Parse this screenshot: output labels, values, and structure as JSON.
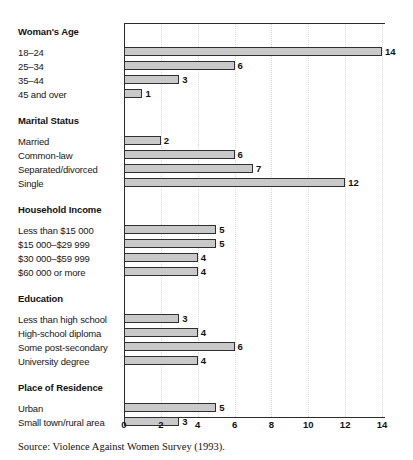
{
  "figure": {
    "source_note": "Source: Violence Against Women Survey (1993)."
  },
  "chart_data": {
    "type": "bar",
    "orientation": "horizontal",
    "title": "",
    "subtitle": "",
    "xlabel": "",
    "ylabel": "",
    "xlim": [
      0,
      14
    ],
    "xticks": [
      0,
      2,
      4,
      6,
      8,
      10,
      12,
      14
    ],
    "xtick_labels": [
      "0",
      "2",
      "4",
      "6",
      "8",
      "10",
      "12",
      "14"
    ],
    "grid": true,
    "grid_axis": "x",
    "grid_style": "dotted",
    "legend": false,
    "bar_color": "#c9c9c9",
    "bar_edge_color": "#2f2f2f",
    "axis_color": "#2b2b2b",
    "value_labels": true,
    "groups": [
      {
        "heading": "Woman's Age",
        "categories": [
          "18–24",
          "25–34",
          "35–44",
          "45 and over"
        ],
        "values": [
          14,
          6,
          3,
          1
        ]
      },
      {
        "heading": "Marital Status",
        "categories": [
          "Married",
          "Common-law",
          "Separated/divorced",
          "Single"
        ],
        "values": [
          2,
          6,
          7,
          12
        ]
      },
      {
        "heading": "Household Income",
        "categories": [
          "Less than $15 000",
          "$15 000–$29 999",
          "$30 000–$59 999",
          "$60 000 or more"
        ],
        "values": [
          5,
          5,
          4,
          4
        ]
      },
      {
        "heading": "Education",
        "categories": [
          "Less than high school",
          "High-school diploma",
          "Some post-secondary",
          "University degree"
        ],
        "values": [
          3,
          4,
          6,
          4
        ]
      },
      {
        "heading": "Place of Residence",
        "categories": [
          "Urban",
          "Small town/rural area"
        ],
        "values": [
          5,
          3
        ]
      }
    ]
  }
}
